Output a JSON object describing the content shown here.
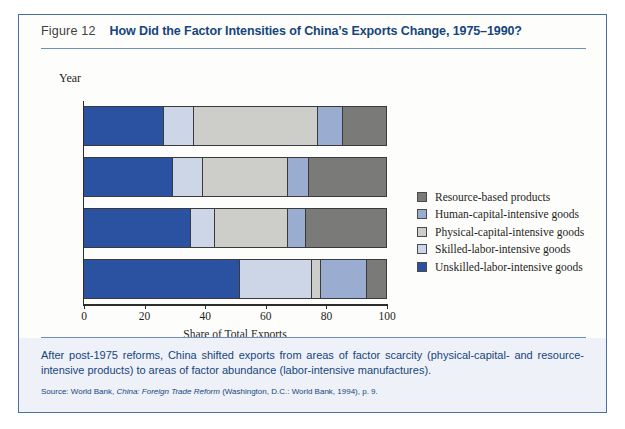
{
  "figure": {
    "number": "Figure 12",
    "title": "How Did the Factor Intensities of China’s Exports Change, 1975–1990?"
  },
  "caption": {
    "text": "After post-1975 reforms, China shifted exports from areas of factor scarcity (physical-capital- and resource-intensive products) to areas of factor abundance (labor-intensive manufactures).",
    "source_prefix": "Source: World Bank, ",
    "source_italic": "China: Foreign Trade Reform",
    "source_suffix": " (Washington, D.C.: World Bank, 1994), p. 9."
  },
  "chart_data": {
    "type": "bar",
    "orientation": "horizontal",
    "stacked": true,
    "title": "How Did the Factor Intensities of China’s Exports Change, 1975–1990?",
    "xlabel": "Share of Total Exports",
    "ylabel": "Year",
    "categories": [
      "1975",
      "1980",
      "1985",
      "1990"
    ],
    "xlim": [
      0,
      100
    ],
    "xticks": [
      0,
      20,
      40,
      60,
      80,
      100
    ],
    "grid": false,
    "legend_position": "right",
    "series": [
      {
        "name": "Unskilled-labor-intensive goods",
        "color": "#2b52a0",
        "values": [
          26,
          29,
          35,
          51
        ]
      },
      {
        "name": "Skilled-labor-intensive goods",
        "color": "#ccd6e6",
        "values": [
          10,
          10,
          8,
          24
        ]
      },
      {
        "name": "Physical-capital-intensive goods",
        "color": "#cdcdc9",
        "values": [
          41,
          28,
          24,
          3
        ]
      },
      {
        "name": "Human-capital-intensive goods",
        "color": "#9aadd1",
        "values": [
          8,
          7,
          6,
          15
        ]
      },
      {
        "name": "Resource-based products",
        "color": "#7a7a78",
        "values": [
          15,
          26,
          27,
          7
        ]
      }
    ],
    "legend_order": [
      "Resource-based products",
      "Human-capital-intensive goods",
      "Physical-capital-intensive goods",
      "Skilled-labor-intensive goods",
      "Unskilled-labor-intensive goods"
    ]
  },
  "colors": {
    "border": "#4a6fa5",
    "title_blue": "#16457e",
    "footer_bg": "#eef2f8"
  }
}
